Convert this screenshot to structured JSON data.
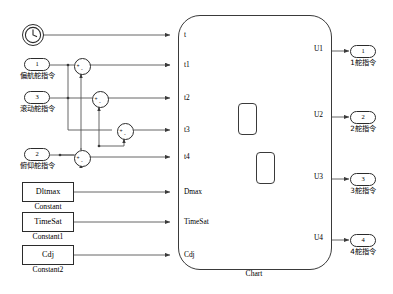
{
  "diagram": {
    "title": "Chart",
    "line_color": "#555555",
    "block_border_color": "#2b2b2b"
  },
  "sources": {
    "clock": {
      "name": "clock-block",
      "icon": "clock-icon"
    },
    "inports": [
      {
        "number": "1",
        "label": "偏航舵指令"
      },
      {
        "number": "3",
        "label": "滚动舵指令"
      },
      {
        "number": "2",
        "label": "俯仰舵指令"
      }
    ],
    "constants": [
      {
        "value": "Dltmax",
        "caption": "Constant"
      },
      {
        "value": "TimeSat",
        "caption": "Constant1"
      },
      {
        "value": "Cdj",
        "caption": "Constant2"
      }
    ]
  },
  "sums": [
    {
      "id": "sum1",
      "signs": [
        "+",
        "-"
      ]
    },
    {
      "id": "sum2",
      "signs": [
        "+",
        "-"
      ]
    },
    {
      "id": "sum3",
      "signs": [
        "+",
        "-"
      ]
    },
    {
      "id": "sum4",
      "signs": [
        "+",
        "-"
      ]
    }
  ],
  "chart": {
    "caption": "Chart",
    "inputs": [
      "t",
      "t1",
      "t2",
      "t3",
      "t4",
      "Dmax",
      "TimeSat",
      "Cdj"
    ],
    "outputs": [
      "U1",
      "U2",
      "U3",
      "U4"
    ],
    "states": [
      {
        "id": "state-a"
      },
      {
        "id": "state-b"
      }
    ]
  },
  "outports": [
    {
      "number": "1",
      "label": "1舵指令"
    },
    {
      "number": "2",
      "label": "2舵指令"
    },
    {
      "number": "3",
      "label": "3舵指令"
    },
    {
      "number": "4",
      "label": "4舵指令"
    }
  ]
}
